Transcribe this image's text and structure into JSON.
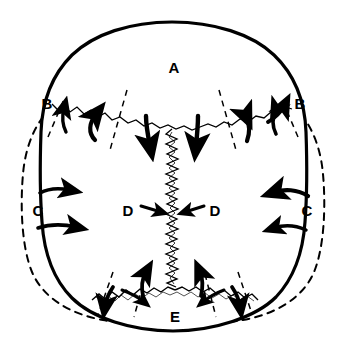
{
  "figure": {
    "background_color": "#ffffff",
    "ink_color": "#000000"
  },
  "labels": [
    {
      "id": "A",
      "text": "A",
      "x": 174,
      "y": 69,
      "name": "label-a-frontal"
    },
    {
      "id": "B_left",
      "text": "B",
      "x": 47,
      "y": 105,
      "name": "label-b-left"
    },
    {
      "id": "B_right",
      "text": "B",
      "x": 300,
      "y": 105,
      "name": "label-b-right"
    },
    {
      "id": "C_left",
      "text": "C",
      "x": 38,
      "y": 212,
      "name": "label-c-left"
    },
    {
      "id": "C_right",
      "text": "C",
      "x": 307,
      "y": 212,
      "name": "label-c-right"
    },
    {
      "id": "D_left",
      "text": "D",
      "x": 128,
      "y": 212,
      "name": "label-d-left"
    },
    {
      "id": "D_right",
      "text": "D",
      "x": 215,
      "y": 212,
      "name": "label-d-right"
    },
    {
      "id": "E",
      "text": "E",
      "x": 175,
      "y": 318,
      "name": "label-e-occipital"
    }
  ],
  "outline": {
    "solid_path": "M 172 22 C 214 22 252 34 274 55 C 296 76 305 104 306 132 C 307 160 307 196 305 222 C 303 252 294 278 276 297 C 256 317 214 331 173 331 C 132 331 92 318 72 298 C 53 279 44 252 42 222 C 40 196 40 160 41 132 C 42 104 51 76 72 55 C 94 34 130 22 172 22 Z",
    "solid_stroke_width": 3.2,
    "dashed_path": "M 63 100 C 40 112 26 140 23 174 C 20 208 22 248 32 272 C 43 298 70 314 103 320 C 140 327 205 327 243 320 C 276 314 303 298 314 272 C 324 248 326 208 323 174 C 320 140 306 112 283 100",
    "dashed_stroke_width": 2.0,
    "dash_pattern": "7,6"
  },
  "sutures": [
    {
      "name": "coronal-suture",
      "type": "wavy-horizontal",
      "description": "Coronal suture separating frontal bone from parietal bones"
    },
    {
      "name": "sagittal-suture",
      "type": "zigzag-vertical",
      "description": "Sagittal suture between the two parietal bones"
    },
    {
      "name": "lambdoid-suture",
      "type": "wavy-inverted-v",
      "description": "Lambdoid suture between parietal bones and occipital bone"
    }
  ],
  "arrows": {
    "coronal_up": {
      "count": 4,
      "direction": "up-outward",
      "name": "coronal-overlap-arrows"
    },
    "coronal_down": {
      "count": 2,
      "direction": "down",
      "name": "frontal-posterior-arrows"
    },
    "lateral_left": {
      "count": 2,
      "direction": "right-outward",
      "name": "left-parietal-expansion-arrows"
    },
    "lateral_right": {
      "count": 2,
      "direction": "left-inward",
      "name": "right-parietal-compression-arrows"
    },
    "sagittal_converging": {
      "count": 2,
      "direction": "inward-horizontal",
      "name": "sagittal-compression-arrows"
    },
    "lambdoid": {
      "count": 4,
      "direction": "up-and-down-outward",
      "name": "lambdoid-overlap-arrows"
    }
  }
}
